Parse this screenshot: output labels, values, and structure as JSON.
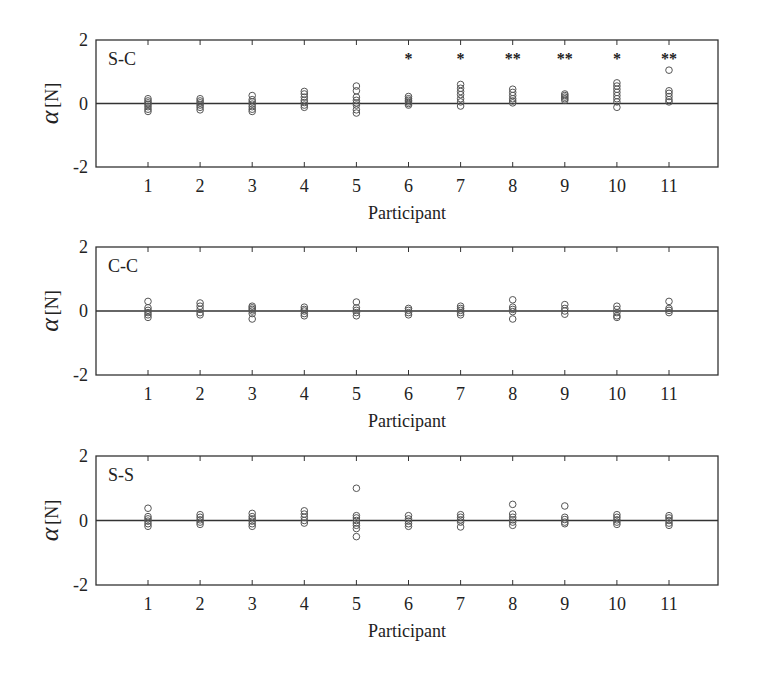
{
  "figure": {
    "xlabel": "Participant",
    "ylabel_symbol": "α",
    "ylabel_unit": "[N]",
    "colors": {
      "axis": "#333333",
      "marker": "#555555",
      "zero_line": "#333333",
      "text": "#222222"
    }
  },
  "chart_data": [
    {
      "type": "scatter",
      "title": "S-C",
      "xlabel": "Participant",
      "ylabel": "α [N]",
      "ylim": [
        -2,
        2
      ],
      "yticks": [
        -2,
        0,
        2
      ],
      "xticks": [
        1,
        2,
        3,
        4,
        5,
        6,
        7,
        8,
        9,
        10,
        11
      ],
      "xlim": [
        0,
        12
      ],
      "zero_line": true,
      "significance": {
        "6": "*",
        "7": "*",
        "8": "**",
        "9": "**",
        "10": "*",
        "11": "**"
      },
      "points": {
        "1": [
          0.15,
          0.08,
          0.02,
          -0.03,
          -0.1,
          -0.18,
          -0.25
        ],
        "2": [
          0.15,
          0.08,
          0.02,
          -0.05,
          -0.12,
          -0.2
        ],
        "3": [
          0.25,
          0.12,
          0.05,
          -0.02,
          -0.1,
          -0.18,
          -0.25
        ],
        "4": [
          0.38,
          0.3,
          0.2,
          0.1,
          0.03,
          -0.05,
          -0.12
        ],
        "5": [
          0.55,
          0.4,
          0.2,
          0.1,
          0.02,
          -0.05,
          -0.2,
          -0.3
        ],
        "6": [
          0.22,
          0.15,
          0.1,
          0.05,
          0.0,
          -0.05
        ],
        "7": [
          0.6,
          0.48,
          0.38,
          0.28,
          0.15,
          0.05,
          -0.08
        ],
        "8": [
          0.45,
          0.35,
          0.25,
          0.15,
          0.08,
          0.02
        ],
        "9": [
          0.3,
          0.25,
          0.2,
          0.15,
          0.1
        ],
        "10": [
          0.65,
          0.55,
          0.45,
          0.35,
          0.25,
          0.15,
          0.05,
          -0.12
        ],
        "11": [
          1.05,
          0.4,
          0.32,
          0.22,
          0.12,
          0.05
        ]
      }
    },
    {
      "type": "scatter",
      "title": "C-C",
      "xlabel": "Participant",
      "ylabel": "α [N]",
      "ylim": [
        -2,
        2
      ],
      "yticks": [
        -2,
        0,
        2
      ],
      "xticks": [
        1,
        2,
        3,
        4,
        5,
        6,
        7,
        8,
        9,
        10,
        11
      ],
      "xlim": [
        0,
        12
      ],
      "zero_line": true,
      "significance": {},
      "points": {
        "1": [
          0.3,
          0.1,
          0.02,
          -0.05,
          -0.12,
          -0.2
        ],
        "2": [
          0.25,
          0.15,
          0.05,
          -0.05,
          -0.12
        ],
        "3": [
          0.15,
          0.1,
          0.05,
          0.0,
          -0.08,
          -0.25
        ],
        "4": [
          0.12,
          0.05,
          0.0,
          -0.08,
          -0.15
        ],
        "5": [
          0.28,
          0.1,
          0.02,
          -0.05,
          -0.15
        ],
        "6": [
          0.08,
          0.02,
          -0.05,
          -0.12
        ],
        "7": [
          0.15,
          0.08,
          0.02,
          -0.05,
          -0.12
        ],
        "8": [
          0.35,
          0.12,
          0.05,
          -0.02,
          -0.25
        ],
        "9": [
          0.2,
          0.08,
          0.0,
          -0.1
        ],
        "10": [
          0.15,
          0.05,
          -0.05,
          -0.15,
          -0.2
        ],
        "11": [
          0.3,
          0.08,
          0.02,
          -0.05
        ]
      }
    },
    {
      "type": "scatter",
      "title": "S-S",
      "xlabel": "Participant",
      "ylabel": "α [N]",
      "ylim": [
        -2,
        2
      ],
      "yticks": [
        -2,
        0,
        2
      ],
      "xticks": [
        1,
        2,
        3,
        4,
        5,
        6,
        7,
        8,
        9,
        10,
        11
      ],
      "xlim": [
        0,
        12
      ],
      "zero_line": true,
      "significance": {},
      "points": {
        "1": [
          0.38,
          0.12,
          0.05,
          -0.02,
          -0.1,
          -0.18
        ],
        "2": [
          0.18,
          0.1,
          0.02,
          -0.05,
          -0.12
        ],
        "3": [
          0.22,
          0.12,
          0.05,
          -0.02,
          -0.1,
          -0.18
        ],
        "4": [
          0.3,
          0.2,
          0.1,
          0.0,
          -0.08
        ],
        "5": [
          1.0,
          0.15,
          0.08,
          0.0,
          -0.08,
          -0.15,
          -0.25,
          -0.5
        ],
        "6": [
          0.15,
          0.05,
          -0.02,
          -0.1,
          -0.18
        ],
        "7": [
          0.18,
          0.1,
          0.02,
          -0.05,
          -0.2
        ],
        "8": [
          0.5,
          0.2,
          0.1,
          0.02,
          -0.05,
          -0.15
        ],
        "9": [
          0.45,
          0.1,
          0.03,
          -0.05,
          -0.1
        ],
        "10": [
          0.18,
          0.1,
          0.02,
          -0.05,
          -0.12
        ],
        "11": [
          0.15,
          0.08,
          0.0,
          -0.08,
          -0.15
        ]
      }
    }
  ]
}
